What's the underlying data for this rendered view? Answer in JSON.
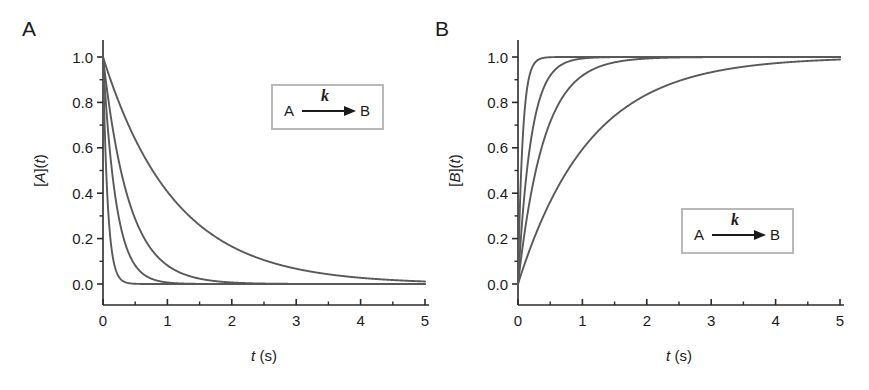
{
  "figure": {
    "background": "#ffffff",
    "curve_color": "#595959",
    "axis_color": "#2b2b2b",
    "inset_border_color": "#b9b9b9"
  },
  "panels": [
    {
      "label": "A",
      "ylabel_pre": "[",
      "ylabel_var": "A",
      "ylabel_mid": "](",
      "ylabel_it": "t",
      "ylabel_post": ")",
      "xlabel_it": "t",
      "xlabel_rest": " (s)",
      "inset": {
        "reactant": "A",
        "rate": "k",
        "product": "B"
      }
    },
    {
      "label": "B",
      "ylabel_pre": "[",
      "ylabel_var": "B",
      "ylabel_mid": "](",
      "ylabel_it": "t",
      "ylabel_post": ")",
      "xlabel_it": "t",
      "xlabel_rest": " (s)",
      "inset": {
        "reactant": "A",
        "rate": "k",
        "product": "B"
      }
    }
  ],
  "chart_data": [
    {
      "type": "line",
      "title": "A",
      "xlabel": "t (s)",
      "ylabel": "[A](t)",
      "xlim": [
        0,
        5
      ],
      "ylim": [
        0.0,
        1.0
      ],
      "xticks": [
        0,
        1,
        2,
        3,
        4,
        5
      ],
      "xtick_labels": [
        "0",
        "1",
        "2",
        "3",
        "4",
        "5"
      ],
      "xminor_ticks": [
        0.5,
        1.5,
        2.5,
        3.5,
        4.5
      ],
      "yticks": [
        0.0,
        0.2,
        0.4,
        0.6,
        0.8,
        1.0
      ],
      "ytick_labels": [
        "0.0",
        "0.2",
        "0.4",
        "0.6",
        "0.8",
        "1.0"
      ],
      "yminor_ticks": [
        0.1,
        0.3,
        0.5,
        0.7,
        0.9
      ],
      "grid": false,
      "legend": "none",
      "equation": "[A](t) = exp(-k t)",
      "series": [
        {
          "name": "k = 14 s^-1",
          "k": 14.0,
          "model": "decay"
        },
        {
          "name": "k = 5 s^-1",
          "k": 5.0,
          "model": "decay"
        },
        {
          "name": "k = 2.5 s^-1",
          "k": 2.5,
          "model": "decay"
        },
        {
          "name": "k = 0.9 s^-1",
          "k": 0.9,
          "model": "decay"
        }
      ]
    },
    {
      "type": "line",
      "title": "B",
      "xlabel": "t (s)",
      "ylabel": "[B](t)",
      "xlim": [
        0,
        5
      ],
      "ylim": [
        0.0,
        1.0
      ],
      "xticks": [
        0,
        1,
        2,
        3,
        4,
        5
      ],
      "xtick_labels": [
        "0",
        "1",
        "2",
        "3",
        "4",
        "5"
      ],
      "xminor_ticks": [
        0.5,
        1.5,
        2.5,
        3.5,
        4.5
      ],
      "yticks": [
        0.0,
        0.2,
        0.4,
        0.6,
        0.8,
        1.0
      ],
      "ytick_labels": [
        "0.0",
        "0.2",
        "0.4",
        "0.6",
        "0.8",
        "1.0"
      ],
      "yminor_ticks": [
        0.1,
        0.3,
        0.5,
        0.7,
        0.9
      ],
      "grid": false,
      "legend": "none",
      "equation": "[B](t) = 1 - exp(-k t)",
      "series": [
        {
          "name": "k = 14 s^-1",
          "k": 14.0,
          "model": "rise"
        },
        {
          "name": "k = 5 s^-1",
          "k": 5.0,
          "model": "rise"
        },
        {
          "name": "k = 2.5 s^-1",
          "k": 2.5,
          "model": "rise"
        },
        {
          "name": "k = 0.9 s^-1",
          "k": 0.9,
          "model": "rise"
        }
      ]
    }
  ]
}
